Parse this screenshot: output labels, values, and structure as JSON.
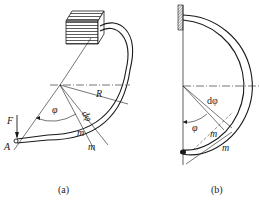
{
  "figures": [
    {
      "id": "a",
      "caption": "(a)",
      "labels": {
        "force": "F",
        "point": "A",
        "radius": "R",
        "angle": "φ",
        "d_angle": "dφ",
        "section_1": "m",
        "section_2": "m"
      }
    },
    {
      "id": "b",
      "caption": "(b)",
      "labels": {
        "angle": "φ",
        "d_angle": "dφ",
        "section_1": "m",
        "section_2": "m"
      }
    }
  ],
  "colors": {
    "line": "#1a1a1a",
    "background": "#ffffff"
  }
}
